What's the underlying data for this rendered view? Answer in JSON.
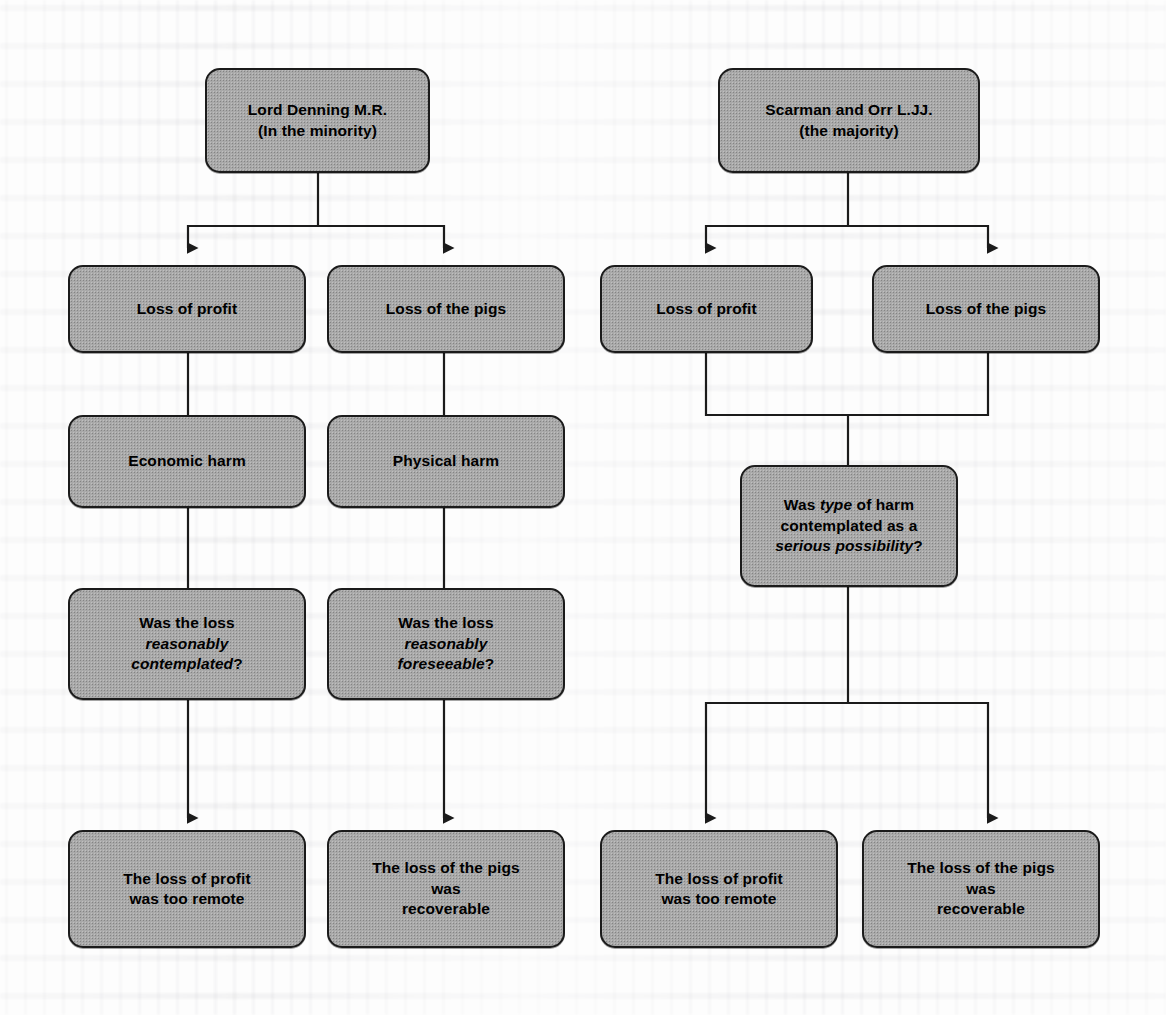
{
  "diagram": {
    "colors": {
      "node_fill": "#a9a9a9",
      "node_border": "#1b1b1b",
      "wire": "#1b1b1b",
      "page_background": "#fdfdfd"
    },
    "nodes": [
      {
        "id": "denning",
        "label_line1": "Lord Denning M.R.",
        "label_line2": "(In the minority)"
      },
      {
        "id": "scarman",
        "label_line1": "Scarman and Orr L.JJ.",
        "label_line2": "(the majority)"
      },
      {
        "id": "d-profit",
        "label_line1": "Loss of profit"
      },
      {
        "id": "d-pigs",
        "label_line1": "Loss of the pigs"
      },
      {
        "id": "s-profit",
        "label_line1": "Loss of profit"
      },
      {
        "id": "s-pigs",
        "label_line1": "Loss of the pigs"
      },
      {
        "id": "economic",
        "label_line1": "Economic harm"
      },
      {
        "id": "physical",
        "label_line1": "Physical harm"
      },
      {
        "id": "s-question",
        "label_line1": "Was ",
        "label_em1": "type",
        "label_line2": " of harm",
        "label_line3": "contemplated as a",
        "label_em2": "serious possibility",
        "label_line4": "?"
      },
      {
        "id": "d-q-profit",
        "label_line1": "Was the loss",
        "label_em1": "reasonably",
        "label_em2": "contemplated",
        "label_line2": "?"
      },
      {
        "id": "d-q-pigs",
        "label_line1": "Was the loss",
        "label_em1": "reasonably",
        "label_em2": "foreseeable",
        "label_line2": "?"
      },
      {
        "id": "d-out-profit",
        "label_line1": "The loss of profit",
        "label_line2": "was too remote"
      },
      {
        "id": "d-out-pigs",
        "label_line1": "The loss of the pigs",
        "label_line2": "was",
        "label_line3": "recoverable"
      },
      {
        "id": "s-out-profit",
        "label_line1": "The loss of profit",
        "label_line2": "was too remote"
      },
      {
        "id": "s-out-pigs",
        "label_line1": "The loss of the pigs",
        "label_line2": "was",
        "label_line3": "recoverable"
      }
    ]
  }
}
